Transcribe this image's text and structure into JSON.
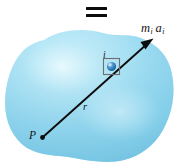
{
  "figure": {
    "background_color": "#ffffff",
    "width": 186,
    "height": 168
  },
  "equals_sign": {
    "glyph": "=",
    "color": "#0b0b0b"
  },
  "body_blob": {
    "name": "rigid-body",
    "fill_color": "#9FDCF0",
    "highlight_color": "#C8EDF8",
    "edge_shadow_color": "#7FCBE6"
  },
  "labels": {
    "force_vector": {
      "base": "m",
      "base_sub": "i",
      "second": "a",
      "second_sub": "i",
      "full": "mi ai"
    },
    "particle": {
      "text": "i"
    },
    "radius": {
      "text": "r"
    },
    "point_p": {
      "text": "P"
    }
  },
  "geometry": {
    "point_p": {
      "x": 42,
      "y": 138
    },
    "particle": {
      "x": 111,
      "y": 66
    },
    "arrow_tip": {
      "x": 153,
      "y": 40
    },
    "arrow_color": "#0d0d0d",
    "particle_box": {
      "x": 103,
      "y": 58,
      "size": 17
    },
    "particle_sphere_color": "#2E7FBF"
  },
  "colors": {
    "blob_light": "#D2F0FA",
    "blob_mid": "#9FDCF0",
    "blob_deep": "#79C8E6",
    "ink": "#0d0d0d",
    "sphere_core": "#1F6FAF"
  }
}
